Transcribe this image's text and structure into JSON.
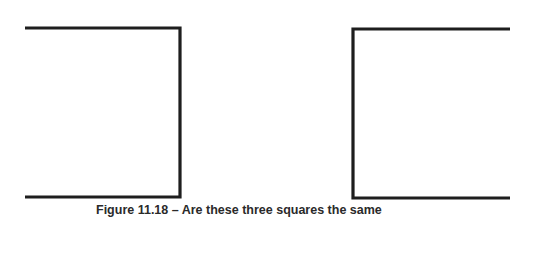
{
  "figure": {
    "caption": "Figure 11.18 – Are these three squares the same",
    "stroke_color": "#1e1e1e",
    "shapes": [
      {
        "name": "left-open-square",
        "opening": "left",
        "x1": 25,
        "x2": 181,
        "y1": 28,
        "y2": 197
      },
      {
        "name": "right-open-square",
        "opening": "right",
        "x1": 353,
        "x2": 510,
        "y1": 29,
        "y2": 198
      }
    ]
  }
}
